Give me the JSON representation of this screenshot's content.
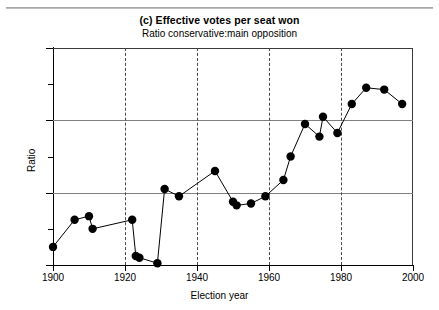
{
  "title": "(c) Effective votes per seat won",
  "subtitle": "Ratio conservative:main opposition",
  "axes": {
    "x_title": "Election year",
    "y_title": "Ratio",
    "y_ticks": [
      "1.4",
      "1.2",
      "1.0",
      ".8"
    ],
    "x_ticks": [
      "1900",
      "1920",
      "1940",
      "1960",
      "1980",
      "2000"
    ]
  },
  "chart_data": {
    "type": "line",
    "title": "(c) Effective votes per seat won",
    "subtitle": "Ratio conservative:main opposition",
    "xlabel": "Election year",
    "ylabel": "Ratio",
    "xlim": [
      1900,
      2000
    ],
    "ylim": [
      0.8,
      1.4
    ],
    "grid": "horizontal solid at 1.0 and 1.2; vertical dashed at 1920, 1940, 1960, 1980",
    "legend": "none",
    "markers": "filled black circles joined by thin black lines",
    "series": [
      {
        "name": "Ratio conservative:main opposition",
        "points": [
          {
            "x": 1900,
            "y": 0.85
          },
          {
            "x": 1906,
            "y": 0.925
          },
          {
            "x": 1910,
            "y": 0.935
          },
          {
            "x": 1911,
            "y": 0.9
          },
          {
            "x": 1922,
            "y": 0.925
          },
          {
            "x": 1923,
            "y": 0.825
          },
          {
            "x": 1924,
            "y": 0.82
          },
          {
            "x": 1929,
            "y": 0.805
          },
          {
            "x": 1931,
            "y": 1.01
          },
          {
            "x": 1935,
            "y": 0.99
          },
          {
            "x": 1945,
            "y": 1.06
          },
          {
            "x": 1950,
            "y": 0.975
          },
          {
            "x": 1951,
            "y": 0.965
          },
          {
            "x": 1955,
            "y": 0.97
          },
          {
            "x": 1959,
            "y": 0.99
          },
          {
            "x": 1964,
            "y": 1.035
          },
          {
            "x": 1966,
            "y": 1.1
          },
          {
            "x": 1970,
            "y": 1.19
          },
          {
            "x": 1974,
            "y": 1.155
          },
          {
            "x": 1975,
            "y": 1.21
          },
          {
            "x": 1979,
            "y": 1.165
          },
          {
            "x": 1983,
            "y": 1.245
          },
          {
            "x": 1987,
            "y": 1.29
          },
          {
            "x": 1992,
            "y": 1.285
          },
          {
            "x": 1997,
            "y": 1.245
          }
        ]
      }
    ]
  }
}
